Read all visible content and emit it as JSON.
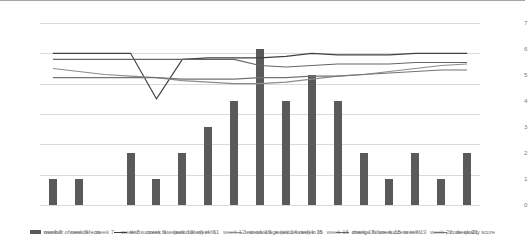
{
  "chart_data": {
    "type": "bar",
    "title": "",
    "xlabel": "",
    "ylabel": "",
    "ylim": [
      0,
      120
    ],
    "y2lim": [
      0,
      7
    ],
    "grid": true,
    "legend_position": "bottom",
    "categories": [
      "week 5",
      "week 6",
      "week 7",
      "week 8",
      "week 9",
      "week 10",
      "week 11",
      "week 12",
      "week 13",
      "week 14",
      "week 15",
      "week 16",
      "week 17",
      "week 18",
      "week 19",
      "week 20",
      "week 21"
    ],
    "ytick_labels": [
      "0%",
      "20%",
      "40%",
      "60%",
      "80%",
      "100%",
      "120%"
    ],
    "ytick_values": [
      0,
      20,
      40,
      60,
      80,
      100,
      120
    ],
    "y2tick_labels": [
      "0",
      "1",
      "2",
      "3",
      "4",
      "5",
      "6",
      "7"
    ],
    "y2tick_values": [
      0,
      1,
      2,
      3,
      4,
      5,
      6,
      7
    ],
    "series": [
      {
        "name": "number of new defects",
        "type": "bar",
        "axis": "secondary",
        "color": "#5a5a5a",
        "values": [
          1,
          1,
          0,
          2,
          1,
          2,
          3,
          4,
          6,
          4,
          5,
          4,
          2,
          1,
          2,
          1,
          2
        ]
      },
      {
        "name": "test success rate (automated) in %",
        "type": "line",
        "axis": "primary",
        "color": "#404040",
        "values": [
          100,
          100,
          100,
          100,
          70,
          96,
          97,
          97,
          97,
          98,
          100,
          99,
          99,
          99,
          100,
          100,
          100
        ]
      },
      {
        "name": "test coverage (automated) in %",
        "type": "line",
        "axis": "primary",
        "color": "#8c8c8c",
        "values": [
          90,
          88,
          86,
          85,
          84,
          82,
          81,
          80,
          80,
          81,
          83,
          85,
          86,
          88,
          90,
          92,
          93
        ]
      },
      {
        "name": "change failure success in %",
        "type": "line",
        "axis": "primary",
        "color": "#666666",
        "values": [
          96,
          96,
          96,
          96,
          96,
          96,
          96,
          96,
          92,
          91,
          92,
          93,
          93,
          93,
          94,
          94,
          94
        ]
      },
      {
        "name": "code quality score",
        "type": "line",
        "axis": "primary",
        "color": "#737373",
        "values": [
          84,
          84,
          84,
          84,
          84,
          83,
          83,
          83,
          84,
          84,
          85,
          85,
          86,
          87,
          88,
          89,
          89
        ]
      }
    ]
  },
  "legend": {
    "items": [
      {
        "label": "number of new defects",
        "swatch": "bar-swatch"
      },
      {
        "label": "test success rate (automated) in %",
        "swatch": "line-swatch"
      },
      {
        "label": "test coverage (automated) in %",
        "swatch": "line-swatch"
      },
      {
        "label": "change failure success in %",
        "swatch": "line-swatch"
      },
      {
        "label": "code quality score",
        "swatch": "line-swatch"
      }
    ]
  }
}
